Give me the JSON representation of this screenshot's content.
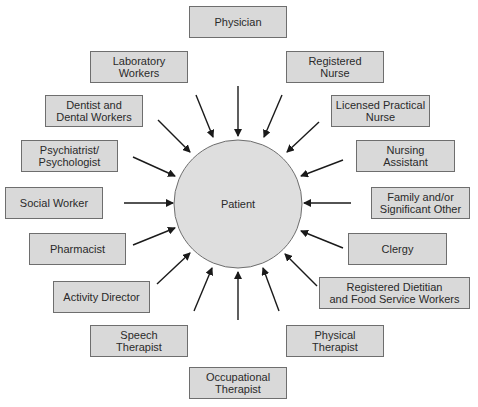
{
  "diagram": {
    "center": {
      "label": "Patient",
      "cx": 238,
      "cy": 204,
      "r": 64,
      "fill": "#dedede",
      "stroke": "#6e6e6e"
    },
    "box_fill": "#d9d9d9",
    "box_stroke": "#6e6e6e",
    "arrow_color": "#1a1a1a",
    "nodes": [
      {
        "id": "physician",
        "label": "Physician",
        "x": 189,
        "y": 6,
        "w": 98,
        "h": 32,
        "arrow": [
          238,
          86,
          238,
          136
        ]
      },
      {
        "id": "laboratory-workers",
        "label": "Laboratory\nWorkers",
        "x": 90,
        "y": 51,
        "w": 98,
        "h": 32,
        "arrow": [
          196,
          95,
          213,
          137
        ]
      },
      {
        "id": "registered-nurse",
        "label": "Registered\nNurse",
        "x": 286,
        "y": 51,
        "w": 98,
        "h": 32,
        "arrow": [
          282,
          95,
          264,
          137
        ]
      },
      {
        "id": "dentist",
        "label": "Dentist and\nDental Workers",
        "x": 45,
        "y": 95,
        "w": 98,
        "h": 32,
        "arrow": [
          158,
          120,
          190,
          152
        ]
      },
      {
        "id": "licensed-practical-nurse",
        "label": "Licensed Practical\nNurse",
        "x": 331,
        "y": 95,
        "w": 99,
        "h": 32,
        "arrow": [
          319,
          122,
          287,
          152
        ]
      },
      {
        "id": "psychiatrist",
        "label": "Psychiatrist/\nPsychologist",
        "x": 21,
        "y": 140,
        "w": 97,
        "h": 32,
        "arrow": [
          133,
          157,
          175,
          176
        ]
      },
      {
        "id": "nursing-assistant",
        "label": "Nursing\nAssistant",
        "x": 356,
        "y": 140,
        "w": 99,
        "h": 32,
        "arrow": [
          343,
          160,
          301,
          176
        ]
      },
      {
        "id": "social-worker",
        "label": "Social Worker",
        "x": 5,
        "y": 187,
        "w": 98,
        "h": 32,
        "arrow": [
          124,
          203,
          173,
          203
        ]
      },
      {
        "id": "family",
        "label": "Family and/or\nSignificant Other",
        "x": 371,
        "y": 187,
        "w": 99,
        "h": 32,
        "arrow": [
          351,
          203,
          304,
          203
        ]
      },
      {
        "id": "pharmacist",
        "label": "Pharmacist",
        "x": 29,
        "y": 233,
        "w": 97,
        "h": 32,
        "arrow": [
          133,
          245,
          175,
          228
        ]
      },
      {
        "id": "clergy",
        "label": "Clergy",
        "x": 348,
        "y": 233,
        "w": 99,
        "h": 32,
        "arrow": [
          343,
          248,
          301,
          231
        ]
      },
      {
        "id": "activity-director",
        "label": "Activity Director",
        "x": 53,
        "y": 281,
        "w": 97,
        "h": 32,
        "arrow": [
          157,
          284,
          190,
          253
        ]
      },
      {
        "id": "registered-dietitian",
        "label": "Registered Dietitian\nand Food Service Workers",
        "x": 319,
        "y": 277,
        "w": 151,
        "h": 32,
        "arrow": [
          317,
          286,
          285,
          254
        ]
      },
      {
        "id": "speech-therapist",
        "label": "Speech\nTherapist",
        "x": 90,
        "y": 325,
        "w": 98,
        "h": 32,
        "arrow": [
          194,
          311,
          212,
          268
        ]
      },
      {
        "id": "physical-therapist",
        "label": "Physical\nTherapist",
        "x": 286,
        "y": 325,
        "w": 98,
        "h": 32,
        "arrow": [
          279,
          311,
          263,
          268
        ]
      },
      {
        "id": "occupational-therapist",
        "label": "Occupational\nTherapist",
        "x": 189,
        "y": 367,
        "w": 98,
        "h": 32,
        "arrow": [
          238,
          320,
          238,
          272
        ]
      }
    ]
  }
}
